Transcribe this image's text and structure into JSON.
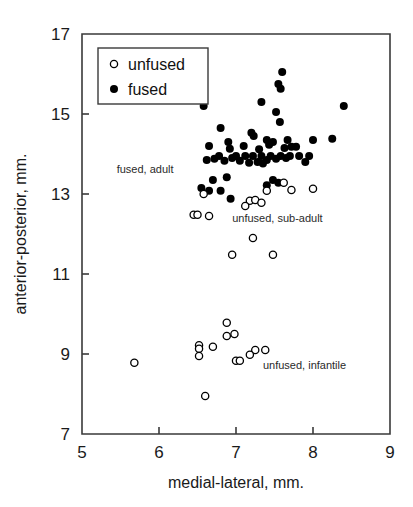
{
  "chart_data": {
    "type": "scatter",
    "title": "",
    "xlabel": "medial-lateral, mm.",
    "ylabel": "anterior-posterior, mm.",
    "xlim": [
      5,
      9
    ],
    "ylim": [
      7,
      17
    ],
    "xticks": [
      "5",
      "6",
      "7",
      "8",
      "9"
    ],
    "yticks": [
      "7",
      "9",
      "11",
      "13",
      "15",
      "17"
    ],
    "xtick_values": [
      5,
      6,
      7,
      8,
      9
    ],
    "ytick_values": [
      7,
      9,
      11,
      13,
      15,
      17
    ],
    "grid": false,
    "legend_position": "top-left",
    "marker_styles": {
      "unfused": "open-circle",
      "fused": "filled-circle"
    },
    "colors": {
      "fused_marker": "#000000",
      "unfused_marker_fill": "#ffffff",
      "unfused_marker_stroke": "#000000",
      "axis": "#3a3a3a",
      "text": "#1a1a1a",
      "background": "#ffffff"
    },
    "series": [
      {
        "name": "fused",
        "marker": "filled-circle",
        "points": [
          [
            7.33,
            15.3
          ],
          [
            7.6,
            16.05
          ],
          [
            7.55,
            15.75
          ],
          [
            7.58,
            15.63
          ],
          [
            7.52,
            15.05
          ],
          [
            7.57,
            14.8
          ],
          [
            6.58,
            15.2
          ],
          [
            8.4,
            15.2
          ],
          [
            6.8,
            14.65
          ],
          [
            7.2,
            14.53
          ],
          [
            7.23,
            14.45
          ],
          [
            6.9,
            14.3
          ],
          [
            7.4,
            14.35
          ],
          [
            7.48,
            14.3
          ],
          [
            7.67,
            14.35
          ],
          [
            7.63,
            14.15
          ],
          [
            8.0,
            14.35
          ],
          [
            8.25,
            14.38
          ],
          [
            6.92,
            14.13
          ],
          [
            7.1,
            14.2
          ],
          [
            7.43,
            14.23
          ],
          [
            7.72,
            14.18
          ],
          [
            7.78,
            14.18
          ],
          [
            6.65,
            14.2
          ],
          [
            7.3,
            14.12
          ],
          [
            7.95,
            13.95
          ],
          [
            6.78,
            13.95
          ],
          [
            6.95,
            13.9
          ],
          [
            7.0,
            13.95
          ],
          [
            7.12,
            13.95
          ],
          [
            7.22,
            13.95
          ],
          [
            7.33,
            13.95
          ],
          [
            7.45,
            13.95
          ],
          [
            7.58,
            13.95
          ],
          [
            7.7,
            13.95
          ],
          [
            6.72,
            13.88
          ],
          [
            6.85,
            13.83
          ],
          [
            7.05,
            13.83
          ],
          [
            7.28,
            13.8
          ],
          [
            7.4,
            13.85
          ],
          [
            7.52,
            13.88
          ],
          [
            7.65,
            13.9
          ],
          [
            7.82,
            13.95
          ],
          [
            6.62,
            13.85
          ],
          [
            7.17,
            13.78
          ],
          [
            7.35,
            13.76
          ],
          [
            7.9,
            13.8
          ],
          [
            6.7,
            13.35
          ],
          [
            6.88,
            13.42
          ],
          [
            7.48,
            13.35
          ],
          [
            7.55,
            13.28
          ],
          [
            6.55,
            13.15
          ],
          [
            6.65,
            13.08
          ],
          [
            6.8,
            13.08
          ],
          [
            7.4,
            13.22
          ],
          [
            6.93,
            12.88
          ]
        ]
      },
      {
        "name": "unfused",
        "marker": "open-circle",
        "points": [
          [
            7.62,
            13.28
          ],
          [
            8.0,
            13.13
          ],
          [
            7.72,
            13.1
          ],
          [
            7.4,
            13.08
          ],
          [
            6.58,
            13.0
          ],
          [
            7.18,
            12.83
          ],
          [
            7.25,
            12.85
          ],
          [
            7.33,
            12.78
          ],
          [
            7.12,
            12.7
          ],
          [
            6.45,
            12.48
          ],
          [
            6.5,
            12.48
          ],
          [
            6.65,
            12.45
          ],
          [
            7.22,
            11.9
          ],
          [
            6.95,
            11.48
          ],
          [
            7.48,
            11.48
          ],
          [
            6.88,
            9.78
          ],
          [
            6.88,
            9.45
          ],
          [
            6.98,
            9.5
          ],
          [
            6.52,
            9.22
          ],
          [
            6.52,
            9.13
          ],
          [
            6.7,
            9.18
          ],
          [
            6.52,
            8.95
          ],
          [
            7.25,
            9.1
          ],
          [
            7.38,
            9.1
          ],
          [
            7.18,
            8.98
          ],
          [
            7.0,
            8.83
          ],
          [
            7.05,
            8.83
          ],
          [
            5.68,
            8.78
          ],
          [
            6.6,
            7.95
          ]
        ]
      }
    ],
    "annotations": [
      {
        "text": "fused, adult",
        "x": 5.45,
        "y": 13.52
      },
      {
        "text": "unfused, sub-adult",
        "x": 6.95,
        "y": 12.3
      },
      {
        "text": "unfused, infantile",
        "x": 7.35,
        "y": 8.63
      }
    ]
  },
  "legend": {
    "entries": [
      {
        "label": "unfused",
        "marker": "open-circle"
      },
      {
        "label": "fused",
        "marker": "filled-circle"
      }
    ]
  }
}
